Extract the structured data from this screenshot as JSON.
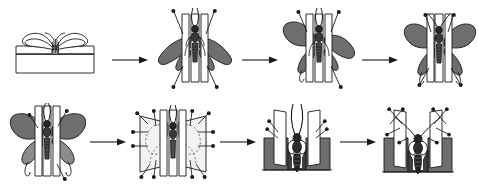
{
  "figure": {
    "title": "Spreading a butterfly specimen on a spreading board",
    "type": "procedural-illustration",
    "steps_total": 8,
    "rows": 2,
    "steps_per_row": 4,
    "style": "line-art halftone engraving",
    "colors": {
      "background": "#ffffff",
      "ink": "#1a1a1a",
      "wing_fill": "#6e6e6e",
      "wing_fill_dark": "#4a4a4a",
      "board_fill": "#ffffff",
      "body_fill": "#262626",
      "paper_strip": "#f2f2f2"
    }
  },
  "steps": [
    {
      "index": 1,
      "name": "relaxed-specimen-on-board",
      "label": "Relaxed butterfly with wings folded resting on spreading board",
      "row": 1,
      "position": 1
    },
    {
      "index": 2,
      "name": "pinned-wings-drooping",
      "label": "Specimen pinned in groove, wings drooping, antennae free",
      "row": 1,
      "position": 2
    },
    {
      "index": 3,
      "name": "left-wing-raised",
      "label": "Left forewing drawn forward and held with setting needle",
      "row": 1,
      "position": 3
    },
    {
      "index": 4,
      "name": "both-wings-positioned",
      "label": "Both forewings and hindwings positioned symmetrically",
      "row": 1,
      "position": 4
    },
    {
      "index": 5,
      "name": "wings-fully-spread",
      "label": "Wings fully spread and held by pins against the board",
      "row": 2,
      "position": 1
    },
    {
      "index": 6,
      "name": "paper-strips-pinned",
      "label": "Paper strips laid over the wings and secured with pins",
      "row": 2,
      "position": 2
    },
    {
      "index": 7,
      "name": "front-view-antennae-free",
      "label": "Front view of mounted specimen with antennae still loose",
      "row": 2,
      "position": 3
    },
    {
      "index": 8,
      "name": "antennae-pinned-complete",
      "label": "Antennae set straight and pinned; spreading complete",
      "row": 2,
      "position": 4
    }
  ],
  "arrows": [
    {
      "name": "arrow-step-1-to-2",
      "from": 1,
      "to": 2,
      "direction": "right"
    },
    {
      "name": "arrow-step-2-to-3",
      "from": 2,
      "to": 3,
      "direction": "right"
    },
    {
      "name": "arrow-step-3-to-4",
      "from": 3,
      "to": 4,
      "direction": "right"
    },
    {
      "name": "arrow-step-4-to-5",
      "from": 4,
      "to": 5,
      "direction": "right"
    },
    {
      "name": "arrow-step-5-to-6",
      "from": 5,
      "to": 6,
      "direction": "right"
    },
    {
      "name": "arrow-step-6-to-7",
      "from": 6,
      "to": 7,
      "direction": "right"
    },
    {
      "name": "arrow-step-7-to-8",
      "from": 7,
      "to": 8,
      "direction": "right"
    }
  ]
}
